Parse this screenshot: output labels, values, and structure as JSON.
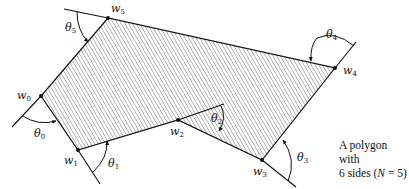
{
  "figure": {
    "caption_line1": "A polygon with",
    "caption_line2_prefix": "6 sides (",
    "caption_line2_var": "N",
    "caption_line2_suffix": " = 5)",
    "vertices": [
      {
        "name": "w",
        "sub": "0",
        "x": 41,
        "y": 96
      },
      {
        "name": "w",
        "sub": "1",
        "x": 78,
        "y": 150
      },
      {
        "name": "w",
        "sub": "2",
        "x": 178,
        "y": 120
      },
      {
        "name": "w",
        "sub": "3",
        "x": 262,
        "y": 160
      },
      {
        "name": "w",
        "sub": "4",
        "x": 335,
        "y": 68
      },
      {
        "name": "w",
        "sub": "5",
        "x": 108,
        "y": 18
      }
    ],
    "angles": [
      {
        "name": "θ",
        "sub": "0"
      },
      {
        "name": "θ",
        "sub": "1"
      },
      {
        "name": "θ",
        "sub": "2"
      },
      {
        "name": "θ",
        "sub": "3"
      },
      {
        "name": "θ",
        "sub": "4"
      },
      {
        "name": "θ",
        "sub": "5"
      }
    ],
    "colors": {
      "stroke": "#111111",
      "hatch": "#555555",
      "background": "#ffffff"
    }
  }
}
